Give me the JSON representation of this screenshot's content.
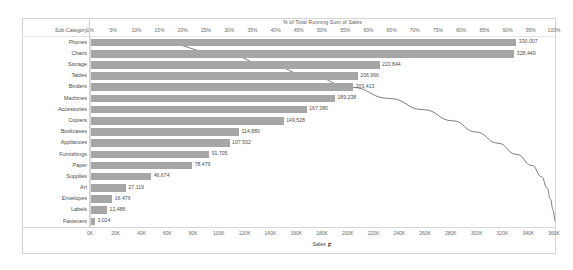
{
  "chart_data": {
    "type": "bar",
    "title": "% of Total Running Sum of Sales",
    "categories_axis_label": "Sub-Category",
    "xlabel": "Sales",
    "ylabel": "Sub-Category",
    "grid": false,
    "legend": "none",
    "categories": [
      "Phones",
      "Chairs",
      "Storage",
      "Tables",
      "Binders",
      "Machines",
      "Accessories",
      "Copiers",
      "Bookcases",
      "Appliances",
      "Furnishings",
      "Paper",
      "Supplies",
      "Art",
      "Envelopes",
      "Labels",
      "Fasteners"
    ],
    "values": [
      330007,
      328449,
      223844,
      206966,
      203413,
      189238,
      167380,
      149528,
      114880,
      107532,
      91705,
      78479,
      46674,
      27119,
      16476,
      12486,
      3024
    ],
    "value_labels": [
      "330,007",
      "328,449",
      "223,844",
      "206,966",
      "203,413",
      "189,238",
      "167,380",
      "149,528",
      "114,880",
      "107,532",
      "91,705",
      "78,479",
      "46,674",
      "27,119",
      "16,476",
      "12,486",
      "3,024"
    ],
    "xlim": [
      0,
      360000
    ],
    "xticks": [
      0,
      20000,
      40000,
      60000,
      80000,
      100000,
      120000,
      140000,
      160000,
      180000,
      200000,
      220000,
      240000,
      260000,
      280000,
      300000,
      320000,
      340000,
      360000
    ],
    "xtick_labels": [
      "0K",
      "20K",
      "40K",
      "60K",
      "80K",
      "100K",
      "120K",
      "140K",
      "160K",
      "180K",
      "200K",
      "220K",
      "240K",
      "260K",
      "280K",
      "300K",
      "320K",
      "340K",
      "360K"
    ],
    "secondary_axis": {
      "label": "% of Total Running Sum of Sales",
      "position": "top",
      "lim": [
        0,
        100
      ],
      "ticks": [
        0,
        5,
        10,
        15,
        20,
        25,
        30,
        35,
        40,
        45,
        50,
        55,
        60,
        65,
        70,
        75,
        80,
        85,
        90,
        95,
        100
      ],
      "tick_labels": [
        "0%",
        "5%",
        "10%",
        "15%",
        "20%",
        "25%",
        "30%",
        "35%",
        "40%",
        "45%",
        "50%",
        "55%",
        "60%",
        "65%",
        "70%",
        "75%",
        "80%",
        "85%",
        "90%",
        "95%",
        "100%"
      ]
    },
    "line_series": {
      "name": "% of Total Running Sum of Sales",
      "values": [
        14.3,
        28.6,
        38.3,
        47.3,
        56.1,
        64.3,
        71.6,
        78.0,
        83.0,
        87.7,
        91.7,
        95.1,
        97.1,
        98.3,
        99.0,
        99.6,
        100.0
      ],
      "color": "#6e6e6e"
    },
    "bar_color": "#a6a6a6",
    "sort_indicator": "F"
  },
  "colors": {
    "background": "#ffffff",
    "frame_border": "#d6d6d6",
    "bar": "#a6a6a6",
    "line": "#6e6e6e",
    "text": "#4a4a4a"
  }
}
